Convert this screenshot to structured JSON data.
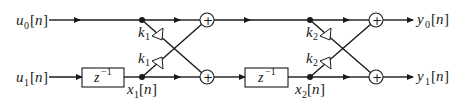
{
  "diagram": {
    "inputs": [
      {
        "var": "u",
        "sub": "0",
        "arg": "n"
      },
      {
        "var": "u",
        "sub": "1",
        "arg": "n"
      }
    ],
    "outputs": [
      {
        "var": "y",
        "sub": "0",
        "arg": "n"
      },
      {
        "var": "y",
        "sub": "1",
        "arg": "n"
      }
    ],
    "stages": [
      {
        "delay": {
          "base": "z",
          "exp": "−1"
        },
        "state": {
          "var": "x",
          "sub": "1",
          "arg": "n"
        },
        "coefficients": [
          {
            "var": "k",
            "sub": "1"
          },
          {
            "var": "k",
            "sub": "1"
          }
        ],
        "adder_symbol": "+"
      },
      {
        "delay": {
          "base": "z",
          "exp": "−1"
        },
        "state": {
          "var": "x",
          "sub": "2",
          "arg": "n"
        },
        "coefficients": [
          {
            "var": "k",
            "sub": "2"
          },
          {
            "var": "k",
            "sub": "2"
          }
        ],
        "adder_symbol": "+"
      }
    ]
  }
}
